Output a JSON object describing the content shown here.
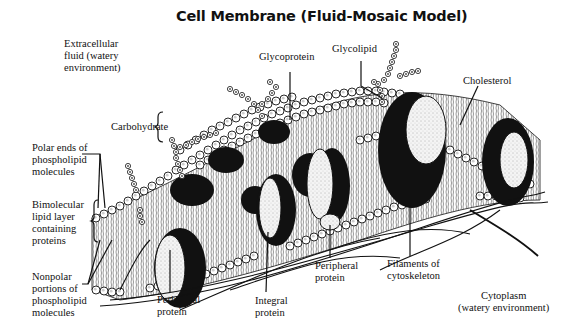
{
  "diagram": {
    "title": "Cell Membrane (Fluid-Mosaic Model)",
    "labels": {
      "extracellular": "Extracellular\nfluid (watery\nenvironment)",
      "glycoprotein": "Glycoprotein",
      "glycolipid": "Glycolipid",
      "cholesterol": "Cholesterol",
      "carbohydrate": "Carbohydrate",
      "polar_ends": "Polar ends of\nphospholipid\nmolecules",
      "bimolecular": "Bimolecular\nlipid layer\ncontaining\nproteins",
      "nonpolar": "Nonpolar\nportions of\nphospholipid\nmolecules",
      "peripheral_protein_left": "Peripheral\nprotein",
      "integral_protein": "Integral\nprotein",
      "peripheral_protein_mid": "Peripheral\nprotein",
      "filaments": "Filaments of\ncytoskeleton",
      "cytoplasm": "Cytoplasm\n(watery environment)"
    },
    "colors": {
      "ink": "#111111",
      "background": "#ffffff",
      "protein_fill": "#f2f2f2"
    }
  }
}
